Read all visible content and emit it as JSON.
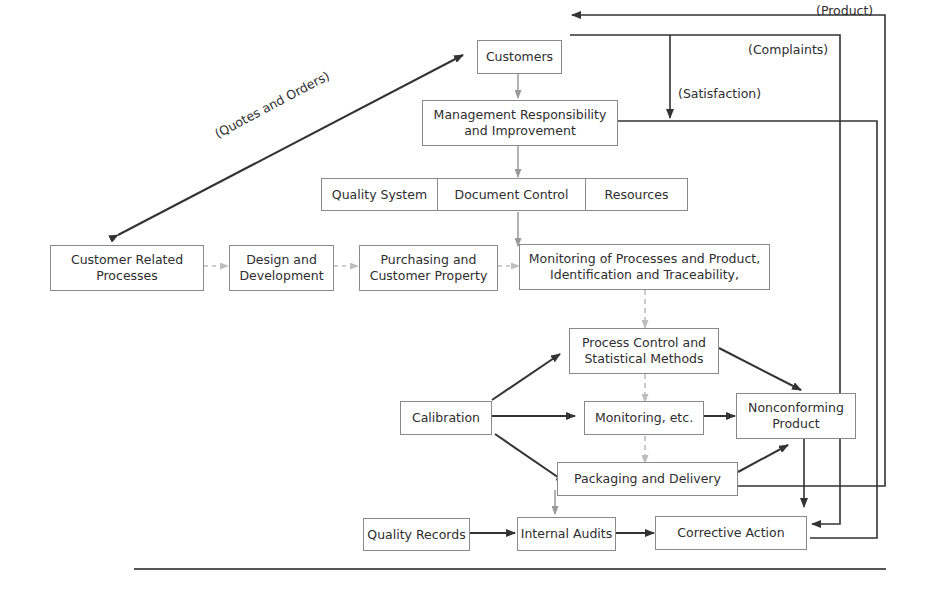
{
  "diagram": {
    "nodes": {
      "customers": "Customers",
      "management": "Management Responsibility and Improvement",
      "management_line1": "Management Responsibility",
      "management_line2": "and Improvement",
      "quality_system": "Quality System",
      "document_control": "Document Control",
      "resources": "Resources",
      "customer_related_line1": "Customer Related",
      "customer_related_line2": "Processes",
      "design_line1": "Design and",
      "design_line2": "Development",
      "purchasing_line1": "Purchasing and",
      "purchasing_line2": "Customer Property",
      "monitoring_processes_line1": "Monitoring of Processes and Product,",
      "monitoring_processes_line2": "Identification and Traceability,",
      "process_control_line1": "Process Control and",
      "process_control_line2": "Statistical Methods",
      "calibration": "Calibration",
      "monitoring_etc": "Monitoring, etc.",
      "nonconforming_line1": "Nonconforming",
      "nonconforming_line2": "Product",
      "packaging": "Packaging and Delivery",
      "quality_records": "Quality Records",
      "internal_audits": "Internal Audits",
      "corrective_action": "Corrective Action"
    },
    "edge_labels": {
      "product": "(Product)",
      "complaints": "(Complaints)",
      "satisfaction": "(Satisfaction)",
      "quotes_orders": "(Quotes and Orders)"
    },
    "colors": {
      "solid_arrow": "#333333",
      "dashed_arrow": "#b5b5b5",
      "box_border": "#8a8a8a"
    }
  }
}
